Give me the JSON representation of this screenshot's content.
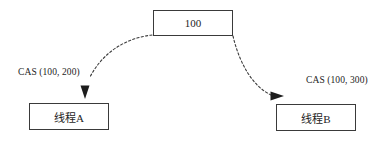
{
  "diagram": {
    "nodes": {
      "shared_value": {
        "label": "100",
        "name": "shared-value-box"
      },
      "thread_a": {
        "label": "线程A",
        "name": "thread-a-box"
      },
      "thread_b": {
        "label": "线程B",
        "name": "thread-b-box"
      }
    },
    "edges": [
      {
        "name": "edge-shared-to-thread-a",
        "label": "CAS (100, 200)",
        "style": "dashed-curved-arrow",
        "direction": "down-left"
      },
      {
        "name": "edge-shared-to-thread-b",
        "label": "CAS (100, 300)",
        "style": "dashed-curved-arrow",
        "direction": "down-right"
      }
    ],
    "colors": {
      "stroke": "#3a3a3a",
      "text": "#1d1d1d",
      "background": "#ffffff"
    }
  }
}
